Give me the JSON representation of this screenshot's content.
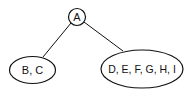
{
  "diagram": {
    "type": "tree",
    "nodes": [
      {
        "id": "root",
        "label": "A"
      },
      {
        "id": "left",
        "label": "B, C"
      },
      {
        "id": "right",
        "label": "D, E, F, G, H, I"
      }
    ],
    "edges": [
      {
        "from": "root",
        "to": "left"
      },
      {
        "from": "root",
        "to": "right"
      }
    ],
    "colors": {
      "stroke": "#111111",
      "background": "#ffffff"
    }
  }
}
